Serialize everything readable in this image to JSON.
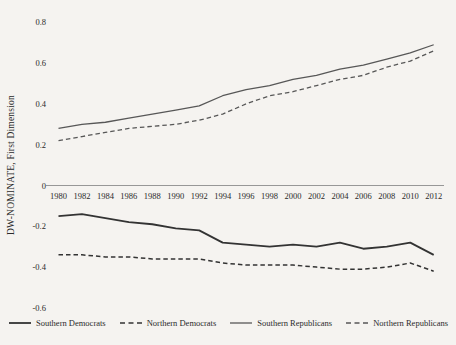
{
  "figure": {
    "background_color": "#f5f3f0",
    "axis_line_color": "#8c8c8c",
    "tick_text_color": "#2a2a2a"
  },
  "chart_data": {
    "type": "line",
    "title": "",
    "xlabel": "",
    "ylabel": "DW-NOMINATE, First Dimension",
    "x": [
      1980,
      1982,
      1984,
      1986,
      1988,
      1990,
      1992,
      1994,
      1996,
      1998,
      2000,
      2002,
      2004,
      2006,
      2008,
      2010,
      2012
    ],
    "x_tick_labels": [
      "1980",
      "1982",
      "1984",
      "1986",
      "1988",
      "1990",
      "1992",
      "1994",
      "1996",
      "1998",
      "2000",
      "2002",
      "2004",
      "2006",
      "2008",
      "2010",
      "2012"
    ],
    "y_ticks": [
      0.8,
      0.6,
      0.4,
      0.2,
      0,
      -0.2,
      -0.4,
      -0.6
    ],
    "y_tick_labels": [
      "0.8",
      "0.6",
      "0.4",
      "0.2",
      "0",
      "-0.2",
      "-0.4",
      "-0.6"
    ],
    "ylim": [
      -0.65,
      0.82
    ],
    "grid": false,
    "legend_position": "bottom",
    "series": [
      {
        "name": "Southern Democrats",
        "line_style": "solid",
        "color": "#333333",
        "stroke_width": 1.8,
        "values": [
          -0.15,
          -0.14,
          -0.16,
          -0.18,
          -0.19,
          -0.21,
          -0.22,
          -0.28,
          -0.29,
          -0.3,
          -0.29,
          -0.3,
          -0.28,
          -0.31,
          -0.3,
          -0.28,
          -0.34
        ]
      },
      {
        "name": "Northern Democrats",
        "line_style": "dashed",
        "color": "#333333",
        "stroke_width": 1.5,
        "values": [
          -0.34,
          -0.34,
          -0.35,
          -0.35,
          -0.36,
          -0.36,
          -0.36,
          -0.38,
          -0.39,
          -0.39,
          -0.39,
          -0.4,
          -0.41,
          -0.41,
          -0.4,
          -0.38,
          -0.42
        ]
      },
      {
        "name": "Southern Republicans",
        "line_style": "solid",
        "color": "#575757",
        "stroke_width": 1.3,
        "values": [
          0.28,
          0.3,
          0.31,
          0.33,
          0.35,
          0.37,
          0.39,
          0.44,
          0.47,
          0.49,
          0.52,
          0.54,
          0.57,
          0.59,
          0.62,
          0.65,
          0.69
        ]
      },
      {
        "name": "Northern Republicans",
        "line_style": "dashed",
        "color": "#575757",
        "stroke_width": 1.3,
        "values": [
          0.22,
          0.24,
          0.26,
          0.28,
          0.29,
          0.3,
          0.32,
          0.35,
          0.4,
          0.44,
          0.46,
          0.49,
          0.52,
          0.54,
          0.58,
          0.61,
          0.66
        ]
      }
    ]
  }
}
